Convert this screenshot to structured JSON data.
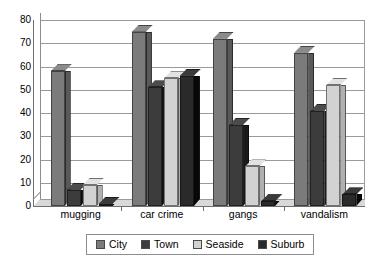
{
  "chart_data": {
    "type": "bar",
    "title": "",
    "subtitle": "",
    "xlabel": "",
    "ylabel": "",
    "categories": [
      "mugging",
      "car crime",
      "gangs",
      "vandalism"
    ],
    "series": [
      {
        "name": "City",
        "color": "#7b7b7b",
        "values": [
          58,
          75,
          72,
          66
        ]
      },
      {
        "name": "Town",
        "color": "#3c3c3c",
        "values": [
          7,
          51,
          35,
          41
        ]
      },
      {
        "name": "Seaside",
        "color": "#d2d2d2",
        "values": [
          9,
          55,
          17,
          52
        ]
      },
      {
        "name": "Suburb",
        "color": "#2a2a2a",
        "values": [
          1,
          56,
          2,
          5
        ]
      }
    ],
    "ylim": [
      0,
      80
    ],
    "ytick_step": 10,
    "yticks": [
      0,
      10,
      20,
      30,
      40,
      50,
      60,
      70,
      80
    ],
    "ytick_labels": [
      "0",
      "10",
      "20",
      "30",
      "40",
      "50",
      "60",
      "70",
      "80"
    ],
    "grid": true,
    "grid_axis": "y",
    "legend": true,
    "legend_position": "bottom",
    "legend_entries": [
      "City",
      "Town",
      "Seaside",
      "Suburb"
    ],
    "style": "3d-column",
    "plot_background": "#ffffff",
    "grid_color": "#9a9a9a",
    "axis_color": "#6f6f6f"
  }
}
